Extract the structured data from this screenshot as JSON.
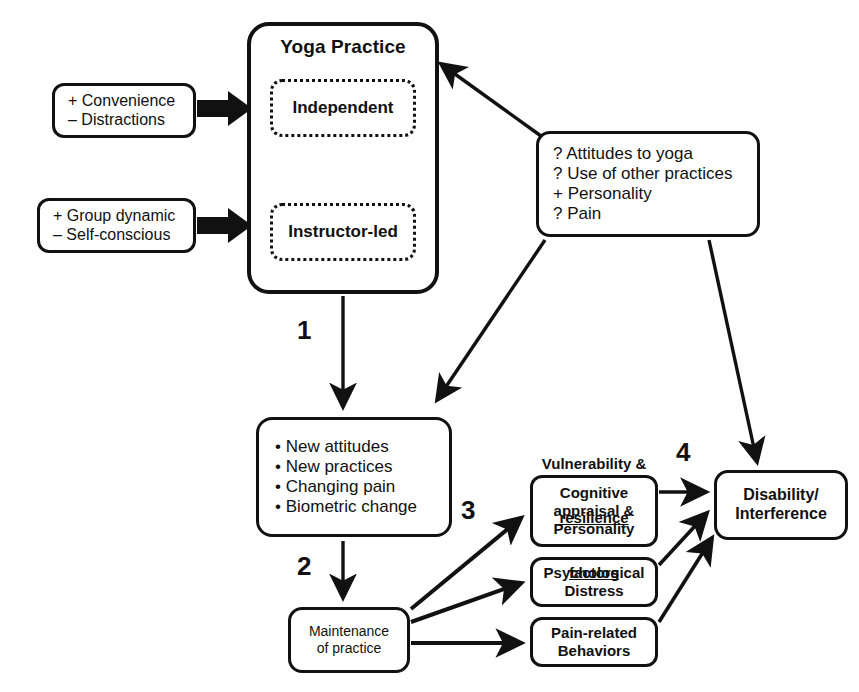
{
  "diagram": {
    "nodes": {
      "yoga_practice": {
        "title": "Yoga Practice",
        "independent": "Independent",
        "instructor_led": "Instructor-led"
      },
      "convenience": {
        "line1": "+ Convenience",
        "line2": "– Distractions"
      },
      "group_dynamic": {
        "line1": "+ Group dynamic",
        "line2": "– Self-conscious"
      },
      "attitudes": {
        "line1": "? Attitudes to yoga",
        "line2": "? Use of other practices",
        "line3": "+ Personality",
        "line4": "? Pain"
      },
      "outcomes": {
        "line1": "• New attitudes",
        "line2": "• New practices",
        "line3": "• Changing pain",
        "line4": "• Biometric change"
      },
      "maintenance": {
        "line1": "Maintenance",
        "line2": "of practice"
      },
      "cognitive": {
        "line1": "Cognitive",
        "line2": "appraisal &",
        "line3": "Personality"
      },
      "distress": {
        "line1": "Psychological",
        "line2": "Distress"
      },
      "pain_related": {
        "line1": "Pain-related",
        "line2": "Behaviors"
      },
      "disability": {
        "line1": "Disability/",
        "line2": "Interference"
      }
    },
    "group_label": {
      "line1": "Vulnerability &",
      "line2": "resilience",
      "line3": "factors"
    },
    "step_labels": {
      "one": "1",
      "two": "2",
      "three": "3",
      "four": "4"
    },
    "colors": {
      "stroke": "#111111",
      "background": "#ffffff"
    }
  }
}
